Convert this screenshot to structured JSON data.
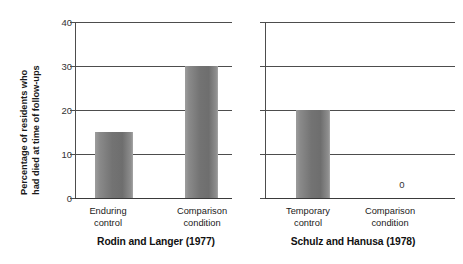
{
  "chart_data": {
    "type": "bar",
    "title": "",
    "subtitle": "",
    "xlabel": "",
    "ylabel_line1": "Percentage of residents who",
    "ylabel_line2": "had died at time of follow-ups",
    "ylim": [
      0,
      40
    ],
    "yticks": [
      "0",
      "10",
      "20",
      "30",
      "40"
    ],
    "grid": true,
    "legend": "none",
    "panels": [
      {
        "group_title": "Rodin and Langer (1977)",
        "categories": [
          "Enduring control",
          "Comparison condition"
        ],
        "category_lines": [
          [
            "Enduring",
            "control"
          ],
          [
            "Comparison",
            "condition"
          ]
        ],
        "values": [
          15,
          30
        ],
        "value_labels": [
          "",
          ""
        ]
      },
      {
        "group_title": "Schulz and Hanusa (1978)",
        "categories": [
          "Temporary control",
          "Comparison condition"
        ],
        "category_lines": [
          [
            "Temporary",
            "control"
          ],
          [
            "Comparison",
            "condition"
          ]
        ],
        "values": [
          20,
          0
        ],
        "value_labels": [
          "",
          "0"
        ]
      }
    ],
    "colors": {
      "bar_fill": "#737373",
      "gridline": "#4d4d4d",
      "text": "#1a1a1a"
    }
  }
}
